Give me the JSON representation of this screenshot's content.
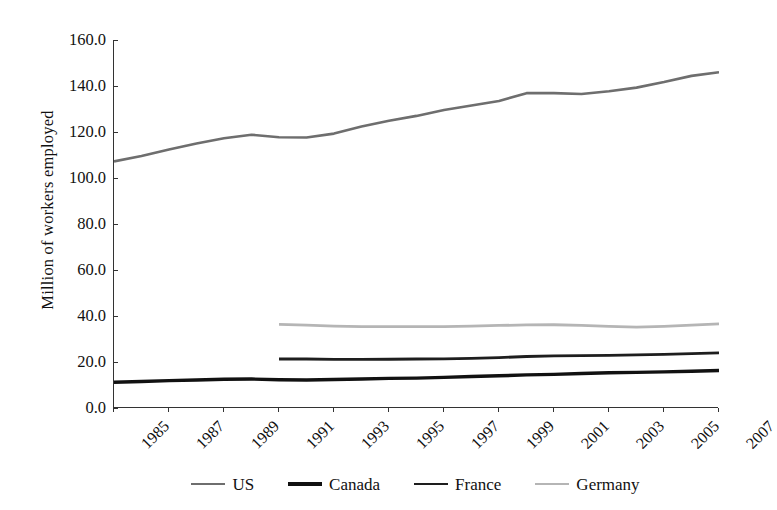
{
  "chart_data": {
    "type": "line",
    "title": "",
    "xlabel": "",
    "ylabel": "Million of workers employed",
    "ylim": [
      0,
      160
    ],
    "ytick_step": 20,
    "ytick_labels": [
      "160.0",
      "140.0",
      "120.0",
      "100.0",
      "80.0",
      "60.0",
      "40.0",
      "20.0",
      "0.0"
    ],
    "ytick_values": [
      160,
      140,
      120,
      100,
      80,
      60,
      40,
      20,
      0
    ],
    "xlim": [
      1985,
      2007
    ],
    "x": [
      1985,
      1986,
      1987,
      1988,
      1989,
      1990,
      1991,
      1992,
      1993,
      1994,
      1995,
      1996,
      1997,
      1998,
      1999,
      2000,
      2001,
      2002,
      2003,
      2004,
      2005,
      2006,
      2007
    ],
    "xtick_labels": [
      "1985",
      "1987",
      "1989",
      "1991",
      "1993",
      "1995",
      "1997",
      "1999",
      "2001",
      "2003",
      "2005",
      "2007"
    ],
    "xtick_values": [
      1985,
      1987,
      1989,
      1991,
      1993,
      1995,
      1997,
      1999,
      2001,
      2003,
      2005,
      2007
    ],
    "grid": false,
    "legend_position": "bottom",
    "series": [
      {
        "name": "US",
        "color": "#6e6e6e",
        "width": 2.6,
        "x": [
          1985,
          1986,
          1987,
          1988,
          1989,
          1990,
          1991,
          1992,
          1993,
          1994,
          1995,
          1996,
          1997,
          1998,
          1999,
          2000,
          2001,
          2002,
          2003,
          2004,
          2005,
          2006,
          2007
        ],
        "values": [
          107.2,
          109.6,
          112.4,
          115.0,
          117.3,
          118.8,
          117.7,
          117.6,
          119.3,
          122.4,
          124.9,
          127.0,
          129.6,
          131.5,
          133.5,
          136.9,
          136.9,
          136.5,
          137.7,
          139.3,
          141.7,
          144.4,
          146.0
        ]
      },
      {
        "name": "Canada",
        "color": "#111111",
        "width": 3.4,
        "x": [
          1985,
          1986,
          1987,
          1988,
          1989,
          1990,
          1991,
          1992,
          1993,
          1994,
          1995,
          1996,
          1997,
          1998,
          1999,
          2000,
          2001,
          2002,
          2003,
          2004,
          2005,
          2006,
          2007
        ],
        "values": [
          11.2,
          11.5,
          11.9,
          12.2,
          12.5,
          12.6,
          12.3,
          12.2,
          12.4,
          12.6,
          12.9,
          13.0,
          13.3,
          13.7,
          14.0,
          14.4,
          14.6,
          15.0,
          15.3,
          15.5,
          15.7,
          16.0,
          16.3
        ]
      },
      {
        "name": "France",
        "color": "#1e1e1e",
        "width": 2.8,
        "x": [
          1991,
          1992,
          1993,
          1994,
          1995,
          1996,
          1997,
          1998,
          1999,
          2000,
          2001,
          2002,
          2003,
          2004,
          2005,
          2006,
          2007
        ],
        "values": [
          21.3,
          21.3,
          21.1,
          21.1,
          21.2,
          21.3,
          21.4,
          21.6,
          21.9,
          22.4,
          22.7,
          22.8,
          22.9,
          23.1,
          23.3,
          23.6,
          24.0
        ]
      },
      {
        "name": "Germany",
        "color": "#b5b5b5",
        "width": 2.8,
        "x": [
          1991,
          1992,
          1993,
          1994,
          1995,
          1996,
          1997,
          1998,
          1999,
          2000,
          2001,
          2002,
          2003,
          2004,
          2005,
          2006,
          2007
        ],
        "values": [
          36.4,
          36.0,
          35.6,
          35.4,
          35.4,
          35.4,
          35.4,
          35.6,
          35.9,
          36.1,
          36.2,
          35.9,
          35.5,
          35.2,
          35.5,
          36.0,
          36.6
        ]
      }
    ]
  },
  "legend": {
    "items": [
      {
        "label": "US"
      },
      {
        "label": "Canada"
      },
      {
        "label": "France"
      },
      {
        "label": "Germany"
      }
    ]
  }
}
